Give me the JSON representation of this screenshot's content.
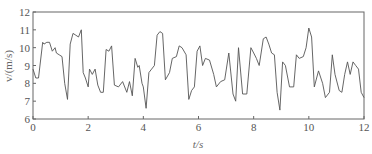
{
  "chart_data": {
    "type": "line",
    "title": "",
    "xlabel": "t/s",
    "ylabel": "v/(m/s)",
    "xlim": [
      0,
      12
    ],
    "ylim": [
      6,
      12
    ],
    "xticks": [
      0,
      2,
      4,
      6,
      8,
      10,
      12
    ],
    "yticks": [
      6,
      7,
      8,
      9,
      10,
      11,
      12
    ],
    "grid": false,
    "legend": null,
    "line_color": "#555555",
    "series": [
      {
        "name": "v",
        "x": [
          0.0,
          0.1,
          0.2,
          0.35,
          0.4,
          0.5,
          0.6,
          0.7,
          0.8,
          0.85,
          0.95,
          1.05,
          1.15,
          1.25,
          1.35,
          1.45,
          1.55,
          1.65,
          1.75,
          1.82,
          1.9,
          2.0,
          2.05,
          2.15,
          2.25,
          2.35,
          2.45,
          2.55,
          2.65,
          2.75,
          2.85,
          2.95,
          3.1,
          3.25,
          3.4,
          3.5,
          3.6,
          3.7,
          3.8,
          3.85,
          3.95,
          4.0,
          4.1,
          4.2,
          4.3,
          4.4,
          4.5,
          4.6,
          4.7,
          4.8,
          4.95,
          5.05,
          5.2,
          5.3,
          5.4,
          5.55,
          5.65,
          5.75,
          5.85,
          5.95,
          6.05,
          6.15,
          6.25,
          6.4,
          6.55,
          6.65,
          6.8,
          6.95,
          7.1,
          7.25,
          7.35,
          7.45,
          7.6,
          7.75,
          7.9,
          8.0,
          8.1,
          8.2,
          8.35,
          8.45,
          8.55,
          8.65,
          8.75,
          8.85,
          8.95,
          9.05,
          9.15,
          9.3,
          9.45,
          9.55,
          9.65,
          9.8,
          9.9,
          10.0,
          10.1,
          10.2,
          10.35,
          10.5,
          10.6,
          10.75,
          10.85,
          10.95,
          11.1,
          11.2,
          11.3,
          11.4,
          11.5,
          11.6,
          11.7,
          11.8,
          11.9,
          12.0
        ],
        "y": [
          8.8,
          8.3,
          8.3,
          10.3,
          10.2,
          10.3,
          10.3,
          9.8,
          10.0,
          9.7,
          9.6,
          9.5,
          8.0,
          7.1,
          10.2,
          10.8,
          10.7,
          10.6,
          11.0,
          8.6,
          8.3,
          7.8,
          8.8,
          8.5,
          8.8,
          7.9,
          7.5,
          7.5,
          9.9,
          9.8,
          10.1,
          7.9,
          7.8,
          8.1,
          7.5,
          8.1,
          7.3,
          9.4,
          8.9,
          9.0,
          8.0,
          7.8,
          6.6,
          8.6,
          8.8,
          9.0,
          10.7,
          10.9,
          10.8,
          8.2,
          8.6,
          9.4,
          9.5,
          10.1,
          10.0,
          9.6,
          7.1,
          7.6,
          7.8,
          9.8,
          10.1,
          9.0,
          9.4,
          9.3,
          8.5,
          7.8,
          8.1,
          8.2,
          9.7,
          7.4,
          7.0,
          10.0,
          7.4,
          7.4,
          10.0,
          9.7,
          9.4,
          9.0,
          10.5,
          10.6,
          10.2,
          9.7,
          9.6,
          7.5,
          6.5,
          9.2,
          9.0,
          7.8,
          7.8,
          9.6,
          9.4,
          9.5,
          10.0,
          11.1,
          10.6,
          7.8,
          8.7,
          8.0,
          7.2,
          7.5,
          9.6,
          8.5,
          7.6,
          7.5,
          8.5,
          9.2,
          8.5,
          9.2,
          9.0,
          8.8,
          7.5,
          7.2
        ]
      }
    ],
    "plot_area_px": {
      "left": 33,
      "top": 12,
      "right": 364,
      "bottom": 119
    }
  }
}
